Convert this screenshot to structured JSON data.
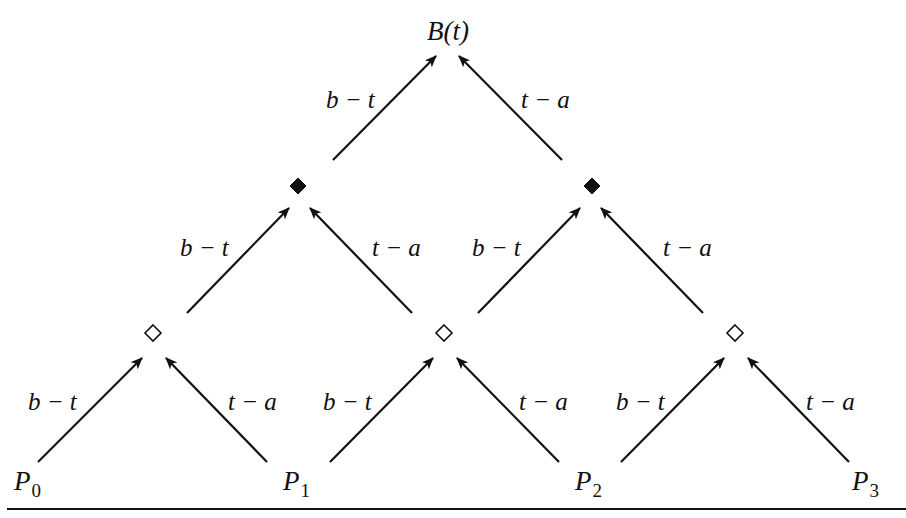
{
  "diagram": {
    "type": "de Casteljau / Bernstein pyramid",
    "top": {
      "id": "B",
      "label": "B(t)",
      "x": 448,
      "y": 40
    },
    "level2": [
      {
        "id": "L2_0",
        "shape": "filled-diamond",
        "x": 298,
        "y": 186
      },
      {
        "id": "L2_1",
        "shape": "filled-diamond",
        "x": 592,
        "y": 186
      }
    ],
    "level1": [
      {
        "id": "L1_0",
        "shape": "open-diamond",
        "x": 153,
        "y": 333
      },
      {
        "id": "L1_1",
        "shape": "open-diamond",
        "x": 444,
        "y": 333
      },
      {
        "id": "L1_2",
        "shape": "open-diamond",
        "x": 735,
        "y": 333
      }
    ],
    "base": [
      {
        "id": "P0",
        "label": "P",
        "sub": "0",
        "x": 14,
        "y": 490
      },
      {
        "id": "P1",
        "label": "P",
        "sub": "1",
        "x": 283,
        "y": 490
      },
      {
        "id": "P2",
        "label": "P",
        "sub": "2",
        "x": 575,
        "y": 490
      },
      {
        "id": "P3",
        "label": "P",
        "sub": "3",
        "x": 852,
        "y": 490
      }
    ],
    "weights": {
      "left": "b − t",
      "right": "t − a"
    },
    "edges": [
      {
        "x1": 38,
        "y1": 462,
        "x2": 142,
        "y2": 358,
        "label": "b − t",
        "lx": 28,
        "ly": 410
      },
      {
        "x1": 267,
        "y1": 462,
        "x2": 166,
        "y2": 358,
        "label": "t − a",
        "lx": 228,
        "ly": 410
      },
      {
        "x1": 330,
        "y1": 462,
        "x2": 433,
        "y2": 358,
        "label": "b − t",
        "lx": 323,
        "ly": 410
      },
      {
        "x1": 559,
        "y1": 462,
        "x2": 457,
        "y2": 358,
        "label": "t − a",
        "lx": 519,
        "ly": 410
      },
      {
        "x1": 621,
        "y1": 462,
        "x2": 724,
        "y2": 358,
        "label": "b − t",
        "lx": 616,
        "ly": 410
      },
      {
        "x1": 849,
        "y1": 462,
        "x2": 748,
        "y2": 358,
        "label": "t − a",
        "lx": 806,
        "ly": 410
      },
      {
        "x1": 187,
        "y1": 313,
        "x2": 289,
        "y2": 208,
        "label": "b − t",
        "lx": 180,
        "ly": 256
      },
      {
        "x1": 412,
        "y1": 313,
        "x2": 310,
        "y2": 208,
        "label": "t − a",
        "lx": 372,
        "ly": 256
      },
      {
        "x1": 478,
        "y1": 313,
        "x2": 580,
        "y2": 208,
        "label": "b − t",
        "lx": 472,
        "ly": 256
      },
      {
        "x1": 703,
        "y1": 313,
        "x2": 601,
        "y2": 208,
        "label": "t − a",
        "lx": 663,
        "ly": 256
      },
      {
        "x1": 333,
        "y1": 160,
        "x2": 436,
        "y2": 56,
        "label": "b − t",
        "lx": 326,
        "ly": 108
      },
      {
        "x1": 562,
        "y1": 160,
        "x2": 459,
        "y2": 56,
        "label": "t − a",
        "lx": 521,
        "ly": 108
      }
    ],
    "rule": {
      "x1": 7,
      "x2": 906,
      "y": 509
    }
  }
}
